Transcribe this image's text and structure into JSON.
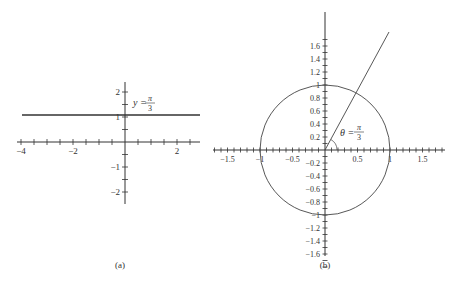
{
  "diagrams": [
    {
      "id": "a",
      "caption": "(a)",
      "equation": {
        "lhs": "y =",
        "num": "π",
        "den": "3"
      },
      "x_tick_labels": [
        {
          "v": -4,
          "label": "−4"
        },
        {
          "v": -2,
          "label": "−2"
        },
        {
          "v": 2,
          "label": "2"
        }
      ],
      "y_tick_labels": [
        {
          "v": 2,
          "label": "2"
        },
        {
          "v": 1,
          "label": "1"
        },
        {
          "v": -1,
          "label": "−1"
        },
        {
          "v": -2,
          "label": "−2"
        }
      ],
      "xrange": [
        -4.1,
        2.9
      ],
      "yrange": [
        -2.4,
        2.4
      ],
      "x_tick_step": 0.5,
      "y_tick_step": 0.5,
      "curve": {
        "type": "horizontal-line",
        "y": 1.0472,
        "x_from": -4,
        "x_to": 2.9
      }
    },
    {
      "id": "b",
      "caption": "(b)",
      "equation": {
        "lhs": "θ =",
        "num": "π",
        "den": "3"
      },
      "x_tick_labels": [
        {
          "v": -1.5,
          "label": "−1.5"
        },
        {
          "v": -1,
          "label": "−1"
        },
        {
          "v": -0.5,
          "label": "−0.5"
        },
        {
          "v": 0.5,
          "label": "0.5"
        },
        {
          "v": 1,
          "label": "1"
        },
        {
          "v": 1.5,
          "label": "1.5"
        }
      ],
      "y_tick_labels": [
        {
          "v": 1.6,
          "label": "1.6"
        },
        {
          "v": 1.4,
          "label": "1.4"
        },
        {
          "v": 1.2,
          "label": "1.2"
        },
        {
          "v": 1,
          "label": "1"
        },
        {
          "v": 0.8,
          "label": "0.8"
        },
        {
          "v": 0.6,
          "label": "0.6"
        },
        {
          "v": 0.4,
          "label": "0.4"
        },
        {
          "v": 0.2,
          "label": "0.2"
        },
        {
          "v": -0.2,
          "label": "−0.2"
        },
        {
          "v": -0.4,
          "label": "−0.4"
        },
        {
          "v": -0.6,
          "label": "−0.6"
        },
        {
          "v": -0.8,
          "label": "−0.8"
        },
        {
          "v": -1,
          "label": "−1"
        },
        {
          "v": -1.2,
          "label": "−1.2"
        },
        {
          "v": -1.4,
          "label": "−1.4"
        },
        {
          "v": -1.6,
          "label": "−1.6"
        }
      ],
      "xrange": [
        -1.7,
        1.8
      ],
      "yrange": [
        -1.8,
        2.1
      ],
      "x_tick_step": 0.1,
      "y_tick_step": 0.1,
      "circle": {
        "cx": 0,
        "cy": 0,
        "r": 1
      },
      "ray": {
        "angle": "π/3",
        "from": [
          0,
          0
        ],
        "to": [
          0.98,
          1.8
        ]
      }
    }
  ]
}
